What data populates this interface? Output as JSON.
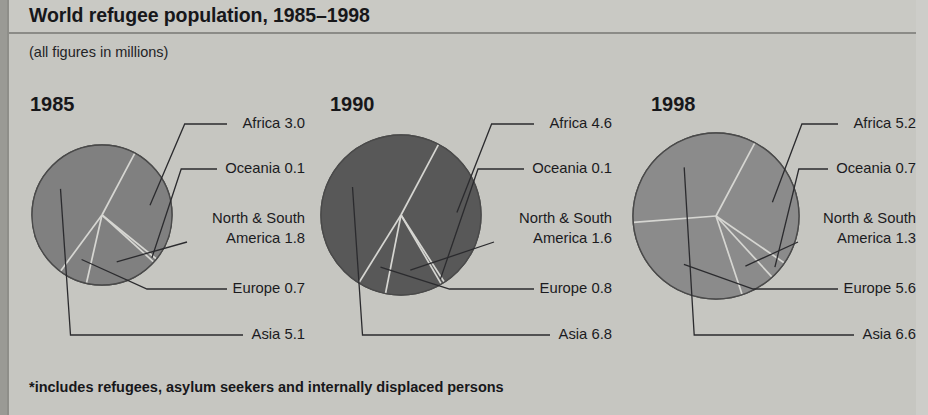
{
  "header": {
    "title": "World refugee population, 1985–1998",
    "subtitle": "(all figures in millions)",
    "footnote": "*includes refugees, asylum seekers and internally displaced persons"
  },
  "colors": {
    "background": "#c6c6c1",
    "header_band": "#c9c9c4",
    "rule": "#8b8b87",
    "pie_1985": "#808080",
    "pie_1990": "#585858",
    "pie_1998": "#8b8b8b",
    "pie_outline": "#4a4a4a",
    "divider_light": "#d6d6d2",
    "leader_line": "#2b2b2e",
    "text": "#17171a"
  },
  "categories": [
    "Africa",
    "Oceania",
    "North & South America",
    "Europe",
    "Asia"
  ],
  "panels": [
    {
      "year": "1985",
      "total": 10.7,
      "labels": [
        {
          "name": "Africa",
          "value": "3.0",
          "text": "Africa 3.0"
        },
        {
          "name": "Oceania",
          "value": "0.1",
          "text": "Oceania 0.1"
        },
        {
          "name": "North & South America",
          "value": "1.8",
          "line1": "North & South",
          "line2": "America 1.8"
        },
        {
          "name": "Europe",
          "value": "0.7",
          "text": "Europe 0.7"
        },
        {
          "name": "Asia",
          "value": "5.1",
          "text": "Asia 5.1"
        }
      ]
    },
    {
      "year": "1990",
      "total": 13.9,
      "labels": [
        {
          "name": "Africa",
          "value": "4.6",
          "text": "Africa 4.6"
        },
        {
          "name": "Oceania",
          "value": "0.1",
          "text": "Oceania 0.1"
        },
        {
          "name": "North & South America",
          "value": "1.6",
          "line1": "North & South",
          "line2": "America 1.6"
        },
        {
          "name": "Europe",
          "value": "0.8",
          "text": "Europe 0.8"
        },
        {
          "name": "Asia",
          "value": "6.8",
          "text": "Asia 6.8"
        }
      ]
    },
    {
      "year": "1998",
      "total": 19.4,
      "labels": [
        {
          "name": "Africa",
          "value": "5.2",
          "text": "Africa 5.2"
        },
        {
          "name": "Oceania",
          "value": "0.7",
          "text": "Oceania 0.7"
        },
        {
          "name": "North & South America",
          "value": "1.3",
          "line1": "North & South",
          "line2": "America 1.3"
        },
        {
          "name": "Europe",
          "value": "5.6",
          "text": "Europe 5.6"
        },
        {
          "name": "Asia",
          "value": "6.6",
          "text": "Asia 6.6"
        }
      ]
    }
  ],
  "chart_data": {
    "type": "pie",
    "title": "World refugee population, 1985–1998",
    "subtitle": "(all figures in millions)",
    "note": "*includes refugees, asylum seekers and internally displaced persons",
    "units": "millions of people",
    "categories": [
      "Africa",
      "Oceania",
      "North & South America",
      "Europe",
      "Asia"
    ],
    "charts": [
      {
        "title": "1985",
        "labels": [
          "Africa",
          "Oceania",
          "North & South America",
          "Europe",
          "Asia"
        ],
        "values": [
          3.0,
          0.1,
          1.8,
          0.7,
          5.1
        ],
        "total": 10.7
      },
      {
        "title": "1990",
        "labels": [
          "Africa",
          "Oceania",
          "North & South America",
          "Europe",
          "Asia"
        ],
        "values": [
          4.6,
          0.1,
          1.6,
          0.8,
          6.8
        ],
        "total": 13.9
      },
      {
        "title": "1998",
        "labels": [
          "Africa",
          "Oceania",
          "North & South America",
          "Europe",
          "Asia"
        ],
        "values": [
          5.2,
          0.7,
          1.3,
          5.6,
          6.6
        ],
        "total": 19.4
      }
    ],
    "legend": "none (slices labelled directly with leader lines)",
    "grid": false
  },
  "geometry": {
    "pies": [
      {
        "cx": 102,
        "cy": 215,
        "r": 70,
        "start_deg": -62
      },
      {
        "cx": 401,
        "cy": 215,
        "r": 80,
        "start_deg": -62
      },
      {
        "cx": 716,
        "cy": 216,
        "r": 83,
        "start_deg": -62
      }
    ],
    "year_pos": [
      {
        "x": 30,
        "y": 93
      },
      {
        "x": 330,
        "y": 93
      },
      {
        "x": 651,
        "y": 93
      }
    ],
    "label_x_right": [
      305,
      612,
      916
    ],
    "label_y": {
      "africa": 115,
      "oceania": 160,
      "nsa": 209,
      "europe": 280,
      "asia": 326
    }
  }
}
